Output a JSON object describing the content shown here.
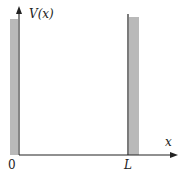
{
  "diagram": {
    "y_axis_label": "V(x)",
    "x_axis_label": "x",
    "tick_labels": {
      "origin": "0",
      "right_wall": "L"
    },
    "colors": {
      "wall_fill": "#b9b9b9",
      "axis": "#222222",
      "background": "#ffffff"
    }
  }
}
